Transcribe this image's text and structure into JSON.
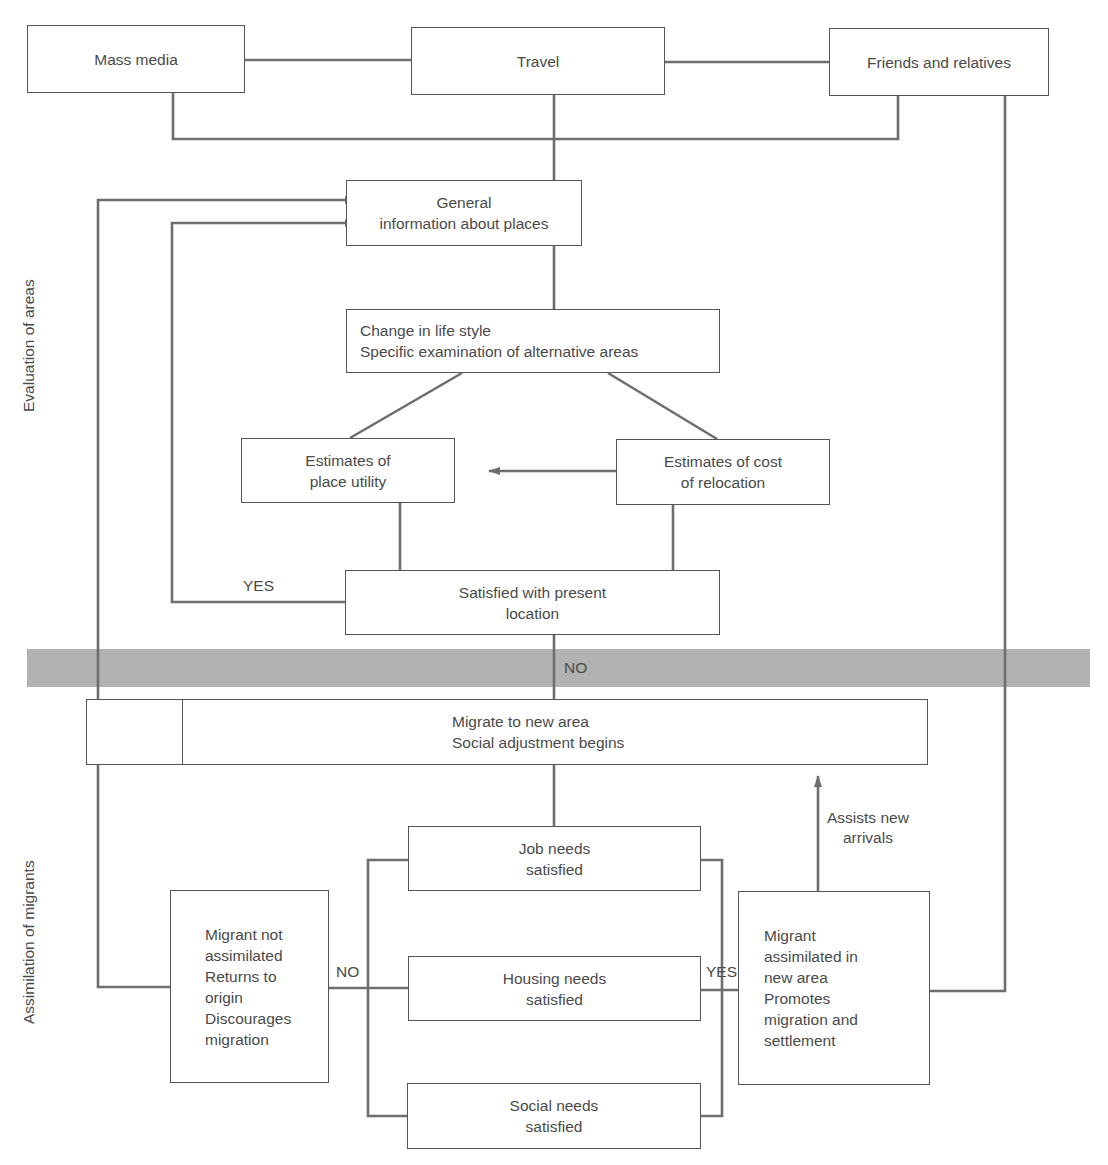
{
  "section_labels": {
    "top": "Evaluation of areas",
    "bottom": "Assimilation of migrants"
  },
  "colors": {
    "line": "#6e6e6e",
    "box_border": "#555555",
    "band": "#b2b2b2",
    "text": "#4a4a4a"
  },
  "nodes": {
    "mass_media": [
      "Mass media"
    ],
    "travel": [
      "Travel"
    ],
    "friends": [
      "Friends and relatives"
    ],
    "general_info": [
      "General",
      "information about places"
    ],
    "change_life": [
      "Change in life style",
      "Specific examination of alternative areas"
    ],
    "place_utility": [
      "Estimates of",
      "place utility"
    ],
    "cost_relocation": [
      "Estimates of cost",
      "of relocation"
    ],
    "satisfied": [
      "Satisfied with present",
      "location"
    ],
    "migrate": [
      "Migrate to new area",
      "Social adjustment begins"
    ],
    "job": [
      "Job needs",
      "satisfied"
    ],
    "housing": [
      "Housing needs",
      "satisfied"
    ],
    "social": [
      "Social needs",
      "satisfied"
    ],
    "not_assimilated": [
      "Migrant not",
      "assimilated",
      "Returns to",
      "origin",
      "Discourages",
      "migration"
    ],
    "assimilated": [
      "Migrant",
      "assimilated in",
      "new area",
      "Promotes",
      "migration and",
      "settlement"
    ]
  },
  "edge_labels": {
    "yes_top": "YES",
    "no_mid": "NO",
    "no_bottom": "NO",
    "yes_bottom": "YES",
    "assists_1": "Assists new",
    "assists_2": "arrivals"
  }
}
